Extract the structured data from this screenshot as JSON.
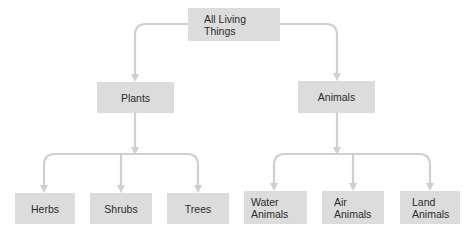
{
  "diagram": {
    "type": "tree",
    "colors": {
      "node_fill": "#dcdcdc",
      "text": "#2b2b2b",
      "connector": "#cfcfcf",
      "background": "#ffffff"
    },
    "root": {
      "label": "All Living\nThings"
    },
    "level1": [
      {
        "label": "Plants"
      },
      {
        "label": "Animals"
      }
    ],
    "plants_children": [
      {
        "label": "Herbs"
      },
      {
        "label": "Shrubs"
      },
      {
        "label": "Trees"
      }
    ],
    "animals_children": [
      {
        "label": "Water\nAnimals"
      },
      {
        "label": "Air\nAnimals"
      },
      {
        "label": "Land\nAnimals"
      }
    ]
  }
}
